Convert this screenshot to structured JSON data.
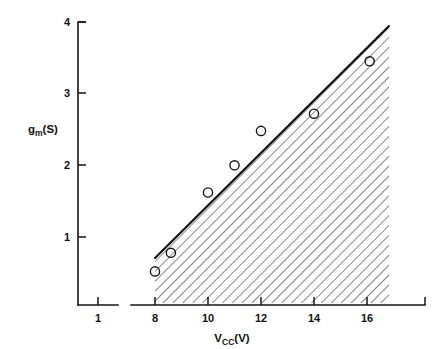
{
  "chart_data": {
    "type": "scatter",
    "title": "",
    "subtitle": "",
    "xlabel": "Vcc(V)",
    "xlabel_base": "V",
    "xlabel_sub": "CC",
    "xlabel_unit": "(V)",
    "ylabel": "gm(S)",
    "ylabel_base": "g",
    "ylabel_sub": "m",
    "ylabel_unit": "(S)",
    "xlim": [
      0.4,
      17.4
    ],
    "ylim": [
      0,
      4.15
    ],
    "grid": false,
    "legend": null,
    "axis_break": true,
    "axis_break_note": "x-axis is broken between 1 and 8",
    "xticks": [
      1,
      8,
      10,
      12,
      14,
      16
    ],
    "xtick_labels": [
      "1",
      "8",
      "10",
      "12",
      "14",
      "16"
    ],
    "yticks": [
      1,
      2,
      3,
      4
    ],
    "ytick_labels": [
      "1",
      "2",
      "3",
      "4"
    ],
    "series": [
      {
        "name": "measured",
        "marker": "open-circle",
        "x": [
          8.0,
          8.6,
          10.0,
          11.0,
          12.0,
          14.0,
          16.1
        ],
        "y": [
          0.52,
          0.78,
          1.62,
          2.0,
          2.48,
          2.72,
          3.45
        ]
      },
      {
        "name": "boundary",
        "marker": "line",
        "x": [
          8.0,
          16.8
        ],
        "y": [
          0.65,
          3.93
        ]
      }
    ],
    "shaded_region": {
      "style": "diagonal-hatch",
      "description": "hatched area below the boundary line, from Vcc=8 to Vcc=16.8",
      "x_start": 8.0,
      "x_end": 16.8
    },
    "colors": {
      "ink": "#141414",
      "hatch": "#2b2b2b",
      "background": "#ffffff"
    }
  }
}
